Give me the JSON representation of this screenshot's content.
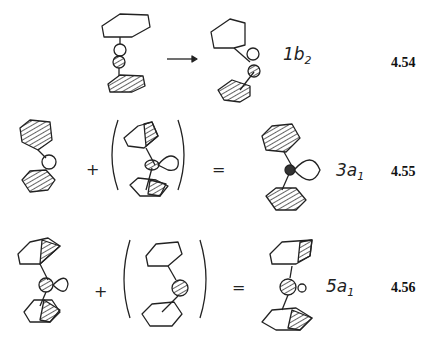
{
  "rows": [
    {
      "orbital_label": "1b",
      "orbital_sub": "2",
      "equation_number": "4.54",
      "operator": "→"
    },
    {
      "orbital_label": "3a",
      "orbital_sub": "1",
      "equation_number": "4.55",
      "plus": "+",
      "equals": "="
    },
    {
      "orbital_label": "5a",
      "orbital_sub": "1",
      "equation_number": "4.56",
      "plus": "+",
      "equals": "="
    }
  ],
  "colors": {
    "ink": "#222222",
    "background": "#ffffff"
  }
}
